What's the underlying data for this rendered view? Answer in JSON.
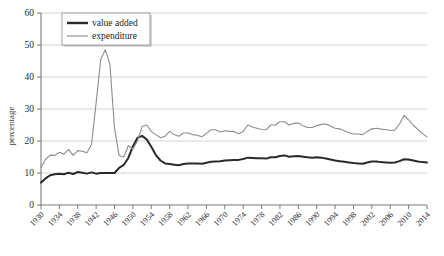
{
  "chart_data": {
    "type": "line",
    "title": "",
    "subtitle": "",
    "xlabel": "",
    "ylabel": "percentage",
    "xlim": [
      1930,
      2014
    ],
    "ylim": [
      0,
      60
    ],
    "grid": true,
    "grid_axis": "y",
    "legend_position": "top-left",
    "y_ticks": [
      0,
      10,
      20,
      30,
      40,
      50,
      60
    ],
    "y_tick_labels": [
      "0",
      "10",
      "20",
      "30",
      "40",
      "50",
      "60"
    ],
    "x_ticks": [
      1930,
      1934,
      1938,
      1942,
      1946,
      1950,
      1954,
      1958,
      1962,
      1966,
      1970,
      1974,
      1978,
      1982,
      1986,
      1990,
      1994,
      1998,
      2002,
      2006,
      2010,
      2014
    ],
    "x_tick_labels": [
      "1930",
      "1934",
      "1938",
      "1942",
      "1946",
      "1950",
      "1954",
      "1958",
      "1962",
      "1966",
      "1970",
      "1974",
      "1978",
      "1982",
      "1986",
      "1990",
      "1994",
      "1998",
      "2002",
      "2006",
      "2010",
      "2014"
    ],
    "x": [
      1930,
      1931,
      1932,
      1933,
      1934,
      1935,
      1936,
      1937,
      1938,
      1939,
      1940,
      1941,
      1942,
      1943,
      1944,
      1945,
      1946,
      1947,
      1948,
      1949,
      1950,
      1951,
      1952,
      1953,
      1954,
      1955,
      1956,
      1957,
      1958,
      1959,
      1960,
      1961,
      1962,
      1963,
      1964,
      1965,
      1966,
      1967,
      1968,
      1969,
      1970,
      1971,
      1972,
      1973,
      1974,
      1975,
      1976,
      1977,
      1978,
      1979,
      1980,
      1981,
      1982,
      1983,
      1984,
      1985,
      1986,
      1987,
      1988,
      1989,
      1990,
      1991,
      1992,
      1993,
      1994,
      1995,
      1996,
      1997,
      1998,
      1999,
      2000,
      2001,
      2002,
      2003,
      2004,
      2005,
      2006,
      2007,
      2008,
      2009,
      2010,
      2011,
      2012,
      2013,
      2014
    ],
    "series": [
      {
        "name": "value added",
        "color": "#2a2a2a",
        "width": 2.0,
        "values": [
          7.0,
          8.3,
          9.3,
          9.6,
          9.8,
          9.6,
          10.1,
          9.7,
          10.3,
          10.1,
          9.8,
          10.2,
          9.8,
          10.0,
          10.0,
          10.0,
          10.0,
          11.6,
          12.5,
          14.7,
          18.3,
          21.0,
          21.6,
          20.5,
          18.2,
          15.6,
          13.9,
          13.0,
          12.8,
          12.6,
          12.4,
          12.8,
          13.0,
          13.0,
          13.0,
          12.9,
          13.2,
          13.5,
          13.6,
          13.7,
          13.9,
          14.0,
          14.1,
          14.1,
          14.4,
          14.8,
          14.7,
          14.6,
          14.6,
          14.5,
          14.9,
          14.9,
          15.3,
          15.5,
          15.1,
          15.2,
          15.3,
          15.1,
          14.9,
          14.8,
          14.9,
          14.8,
          14.5,
          14.2,
          13.9,
          13.7,
          13.5,
          13.3,
          13.1,
          13.0,
          12.9,
          13.3,
          13.6,
          13.6,
          13.4,
          13.3,
          13.2,
          13.3,
          13.7,
          14.3,
          14.2,
          13.9,
          13.6,
          13.4,
          13.3
        ]
      },
      {
        "name": "expenditure",
        "color": "#8d8d8d",
        "width": 1.1,
        "values": [
          11.8,
          14.3,
          15.6,
          15.5,
          16.5,
          15.9,
          17.4,
          15.5,
          17.0,
          16.8,
          16.3,
          19.0,
          32.0,
          45.5,
          48.5,
          44.0,
          24.0,
          15.5,
          15.0,
          18.5,
          17.5,
          20.0,
          24.5,
          25.0,
          23.0,
          22.0,
          21.0,
          21.5,
          23.0,
          22.0,
          21.5,
          22.5,
          22.5,
          22.0,
          21.8,
          21.3,
          22.4,
          23.5,
          23.5,
          22.8,
          23.2,
          23.0,
          23.0,
          22.3,
          23.0,
          25.0,
          24.4,
          24.0,
          23.6,
          23.5,
          25.0,
          25.0,
          26.0,
          26.0,
          25.0,
          25.5,
          25.6,
          24.8,
          24.2,
          24.2,
          24.8,
          25.2,
          25.3,
          24.7,
          24.0,
          23.8,
          23.2,
          22.6,
          22.2,
          22.2,
          22.0,
          23.0,
          23.8,
          24.0,
          23.7,
          23.6,
          23.3,
          23.4,
          25.3,
          28.0,
          26.6,
          25.0,
          23.6,
          22.3,
          21.3
        ]
      }
    ],
    "legend": [
      {
        "label": "value added",
        "color": "#2a2a2a",
        "width": 2.4
      },
      {
        "label": "expenditure",
        "color": "#8d8d8d",
        "width": 1.1
      }
    ]
  },
  "axes": {
    "y_title": "percentage"
  },
  "colors": {
    "gridline": "#c9c9c9",
    "axis": "#7b7b7b",
    "value_added": "#2a2a2a",
    "expenditure": "#8d8d8d",
    "background": "#ffffff"
  }
}
